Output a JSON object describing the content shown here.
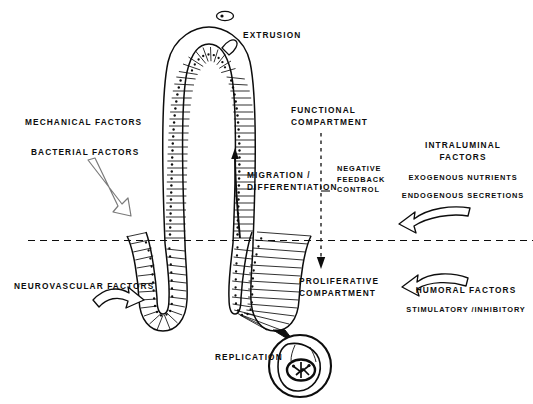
{
  "figure": {
    "background_color": "#ffffff",
    "ink_color": "#0d0d0d"
  },
  "labels": {
    "extrusion": "EXTRUSION",
    "mechanical_factors": "MECHANICAL FACTORS",
    "bacterial_factors": "BACTERIAL FACTORS",
    "neurovascular_factors": "NEUROVASCULAR FACTORS",
    "functional_compartment_line1": "FUNCTIONAL",
    "functional_compartment_line2": "COMPARTMENT",
    "proliferative_compartment_line1": "PROLIFERATIVE",
    "proliferative_compartment_line2": "COMPARTMENT",
    "migration_line1": "MIGRATION /",
    "migration_line2": "DIFFERENTIATION",
    "negative_feedback_line1": "NEGATIVE",
    "negative_feedback_line2": "FEEDBACK",
    "negative_feedback_line3": "CONTROL",
    "intraluminal_line1": "INTRALUMINAL",
    "intraluminal_line2": "FACTORS",
    "exogenous_nutrients": "EXOGENOUS NUTRIENTS",
    "endogenous_secretions": "ENDOGENOUS SECRETIONS",
    "humoral_factors": "HUMORAL FACTORS",
    "stimulatory_inhibitory": "STIMULATORY /INHIBITORY",
    "replication": "REPLICATION"
  },
  "icons": {
    "extruded_cell": "extruded-cell-icon",
    "villus": "villus-icon",
    "crypt_left": "crypt-left-icon",
    "crypt_right": "crypt-right-icon",
    "replication_callout": "replication-callout-icon",
    "migration_arrow": "migration-arrow-icon",
    "negative_feedback_arrow": "negative-feedback-arrow-icon",
    "compartment_divider": "compartment-divider-icon",
    "mechanical_bacterial_arrow": "mechanical-bacterial-arrow-icon",
    "neurovascular_arrow": "neurovascular-arrow-icon",
    "intraluminal_arrow": "intraluminal-arrow-icon",
    "humoral_arrow": "humoral-arrow-icon"
  }
}
